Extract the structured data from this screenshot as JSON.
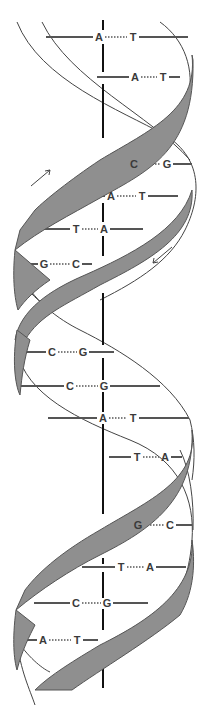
{
  "colors": {
    "ribbon": "#8f8f8f",
    "ribbon_edge": "#555555",
    "line": "#555555",
    "axis": "#111111",
    "text": "#3a3a3a"
  },
  "base_pairs": [
    {
      "left": "A",
      "right": "T",
      "y": 37,
      "lx": 99,
      "rx": 133,
      "x1": 46,
      "x2": 188
    },
    {
      "left": "A",
      "right": "T",
      "y": 77,
      "lx": 135,
      "rx": 163,
      "x1": 97,
      "x2": 180
    },
    {
      "left": "C",
      "right": "G",
      "y": 164,
      "lx": 134,
      "rx": 167,
      "x1": 116,
      "x2": 192
    },
    {
      "left": "A",
      "right": "T",
      "y": 196,
      "lx": 111,
      "rx": 142,
      "x1": 68,
      "x2": 178
    },
    {
      "left": "T",
      "right": "A",
      "y": 229,
      "lx": 76,
      "rx": 104,
      "x1": 34,
      "x2": 143
    },
    {
      "left": "G",
      "right": "C",
      "y": 264,
      "lx": 44,
      "rx": 76,
      "x1": 17,
      "x2": 92
    },
    {
      "left": "C",
      "right": "G",
      "y": 352,
      "lx": 52,
      "rx": 83,
      "x1": 23,
      "x2": 114
    },
    {
      "left": "C",
      "right": "G",
      "y": 386,
      "lx": 70,
      "rx": 104,
      "x1": 21,
      "x2": 160
    },
    {
      "left": "A",
      "right": "T",
      "y": 418,
      "lx": 103,
      "rx": 133,
      "x1": 48,
      "x2": 189
    },
    {
      "left": "T",
      "right": "A",
      "y": 457,
      "lx": 137,
      "rx": 165,
      "x1": 109,
      "x2": 182
    },
    {
      "left": "G",
      "right": "C",
      "y": 525,
      "lx": 138,
      "rx": 170,
      "x1": 125,
      "x2": 192
    },
    {
      "left": "T",
      "right": "A",
      "y": 567,
      "lx": 121,
      "rx": 150,
      "x1": 82,
      "x2": 186
    },
    {
      "left": "C",
      "right": "G",
      "y": 603,
      "lx": 76,
      "rx": 107,
      "x1": 34,
      "x2": 148
    },
    {
      "left": "A",
      "right": "T",
      "y": 640,
      "lx": 43,
      "rx": 77,
      "x1": 17,
      "x2": 98
    }
  ],
  "arrows": [
    {
      "direction": "up-right",
      "x": 40,
      "y": 183
    },
    {
      "direction": "down-left",
      "x": 162,
      "y": 258
    }
  ]
}
